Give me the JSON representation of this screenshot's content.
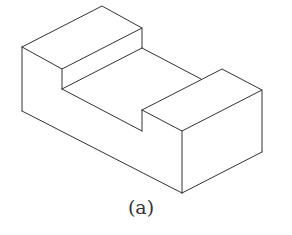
{
  "figure": {
    "caption": "(a)",
    "stroke_color": "#333333",
    "background": "#ffffff"
  }
}
